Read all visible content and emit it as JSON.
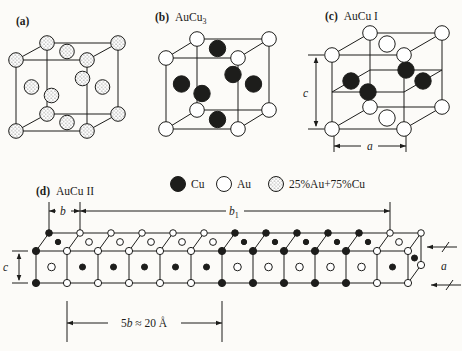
{
  "figure": {
    "background": "#fcfbf8",
    "ink": "#1d1d1b"
  },
  "panels": {
    "a": {
      "label": "(a)"
    },
    "b": {
      "label": "(b)",
      "title_base": "AuCu",
      "title_sub": "3"
    },
    "c": {
      "label": "(c)",
      "title": "AuCu I"
    },
    "d": {
      "label": "(d)",
      "title": "AuCu II"
    }
  },
  "legend": {
    "items": [
      {
        "symbol": "cu-filled-circle",
        "label": "Cu"
      },
      {
        "symbol": "au-open-circle",
        "label": "Au"
      },
      {
        "symbol": "stippled-circle",
        "label": "25%Au+75%Cu"
      }
    ]
  },
  "dimensions": {
    "unit_c": "c",
    "unit_a": "a",
    "row_c": "c",
    "row_a": "a",
    "b_base": "b",
    "b1_base": "b",
    "b1_sub": "1",
    "fiveb_coeff": "5",
    "fiveb_var": "b",
    "fiveb_rest": " ≈ 20 Å"
  },
  "structures": {
    "a_disordered": {
      "corners": "mix",
      "faces": {
        "top": "mix",
        "bottom": "mix",
        "left": "mix",
        "right": "mix",
        "front": "mix",
        "back": "mix"
      }
    },
    "b_aucu3": {
      "corners": "au",
      "faces": {
        "top": "cu",
        "bottom": "cu",
        "left": "cu",
        "right": "cu",
        "front": "cu",
        "back": "cu"
      }
    },
    "c_aucu1": {
      "corners": "au",
      "faces": {
        "top": "au",
        "bottom": "au",
        "left": "cu",
        "right": "cu",
        "front": "cu",
        "back": "cu"
      }
    },
    "d_aucu2": {
      "cells": 12,
      "corner_columns": [
        "cu",
        "au",
        "au",
        "au",
        "au",
        "au",
        "cu",
        "cu",
        "cu",
        "cu",
        "cu",
        "au",
        "au"
      ],
      "front_centers": [
        "au",
        "cu",
        "cu",
        "cu",
        "cu",
        "cu",
        "au",
        "au",
        "au",
        "au",
        "au",
        "cu"
      ],
      "top_centers": [
        "cu",
        "au",
        "au",
        "au",
        "au",
        "au",
        "cu",
        "cu",
        "cu",
        "cu",
        "cu",
        "au"
      ],
      "end_face_center": "cu",
      "end_face_corner": "au"
    }
  }
}
